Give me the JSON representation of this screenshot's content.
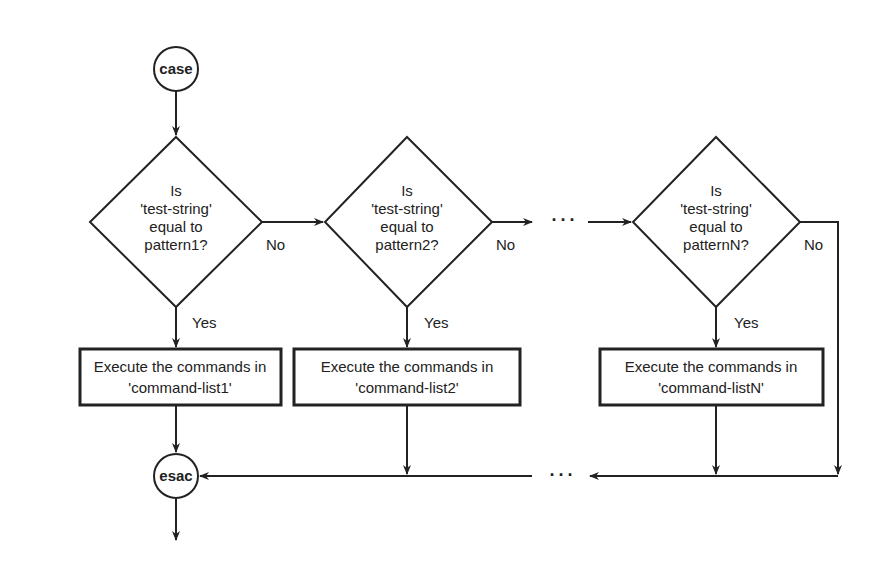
{
  "diagram": {
    "start": {
      "label": "case"
    },
    "end": {
      "label": "esac"
    },
    "decisions": [
      {
        "line1": "Is",
        "line2": "'test-string'",
        "line3": "equal to",
        "line4": "pattern1?",
        "no_label": "No",
        "yes_label": "Yes"
      },
      {
        "line1": "Is",
        "line2": "'test-string'",
        "line3": "equal to",
        "line4": "pattern2?",
        "no_label": "No",
        "yes_label": "Yes"
      },
      {
        "line1": "Is",
        "line2": "'test-string'",
        "line3": "equal to",
        "line4": "patternN?",
        "no_label": "No",
        "yes_label": "Yes"
      }
    ],
    "actions": [
      {
        "line1": "Execute the commands in",
        "line2": "'command-list1'"
      },
      {
        "line1": "Execute the commands in",
        "line2": "'command-list2'"
      },
      {
        "line1": "Execute the commands in",
        "line2": "'command-listN'"
      }
    ],
    "ellipsis_top": "···",
    "ellipsis_bottom": "···"
  }
}
